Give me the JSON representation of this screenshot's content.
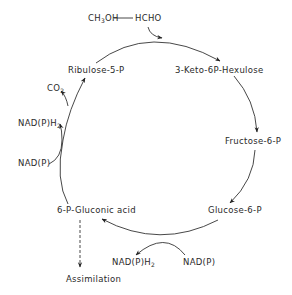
{
  "diagram": {
    "type": "metabolic-cycle",
    "title": "",
    "input": {
      "substrate": "CH3OH",
      "substrate_main": "CH",
      "substrate_sub": "3",
      "substrate_tail": "OH",
      "product": "HCHO"
    },
    "nodes": [
      {
        "id": "ribulose",
        "label": "Ribulose-5-P"
      },
      {
        "id": "hexulose",
        "label": "3-Keto-6P-Hexulose"
      },
      {
        "id": "fructose",
        "label": "Fructose-6-P"
      },
      {
        "id": "glucose",
        "label": "Glucose-6-P"
      },
      {
        "id": "gluconic",
        "label": "6-P-Gluconic acid"
      }
    ],
    "cofactors": {
      "co2": {
        "main": "CO",
        "sub": "2"
      },
      "left_nadph": {
        "main": "NAD(P)H",
        "sub": "2"
      },
      "left_nadp": {
        "label": "NAD(P)"
      },
      "bottom_nadph": {
        "main": "NAD(P)H",
        "sub": "2"
      },
      "bottom_nadp": {
        "label": "NAD(P)"
      }
    },
    "output": {
      "label": "Assimilation"
    },
    "edges": [
      {
        "from": "HCHO",
        "to": "cycle",
        "style": "solid"
      },
      {
        "from": "ribulose",
        "to": "hexulose",
        "style": "solid"
      },
      {
        "from": "hexulose",
        "to": "fructose",
        "style": "solid"
      },
      {
        "from": "fructose",
        "to": "glucose",
        "style": "solid"
      },
      {
        "from": "glucose",
        "to": "gluconic",
        "style": "solid"
      },
      {
        "from": "gluconic",
        "to": "ribulose",
        "style": "solid"
      },
      {
        "from": "gluconic",
        "to": "assimilation",
        "style": "dashed"
      }
    ],
    "colors": {
      "line": "#333333",
      "text": "#2a2a2a",
      "background": "#ffffff"
    }
  }
}
